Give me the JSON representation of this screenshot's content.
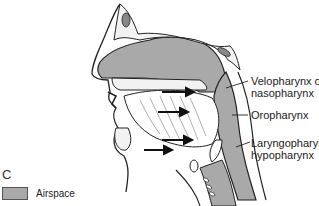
{
  "figure": {
    "panel_letter": "C",
    "labels": [
      {
        "line1": "Velopharynx or",
        "line2": "nasopharynx"
      },
      {
        "line1": "Oropharynx",
        "line2": ""
      },
      {
        "line1": "Laryngopharynx or",
        "line2": "hypopharynx"
      }
    ],
    "legend": {
      "label": "Airspace",
      "color": "#a9a9a9"
    },
    "colors": {
      "airspace": "#a9a9a9",
      "outline": "#222222",
      "bone_fill": "#f2f2f2",
      "background": "#ffffff"
    },
    "arrows": 4
  }
}
